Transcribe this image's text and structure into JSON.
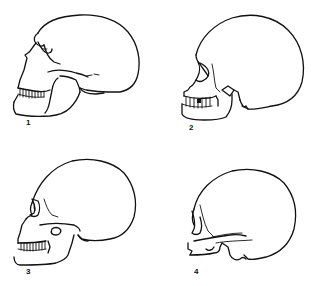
{
  "figure": {
    "panels": [
      {
        "id": 1,
        "label": "1",
        "subject": "skull-profile-left-view"
      },
      {
        "id": 2,
        "label": "2",
        "subject": "skull-profile-left-view"
      },
      {
        "id": 3,
        "label": "3",
        "subject": "skull-profile-left-view"
      },
      {
        "id": 4,
        "label": "4",
        "subject": "skull-profile-left-view-no-mandible"
      }
    ],
    "colors": {
      "line": "#111111",
      "background": "#ffffff"
    }
  }
}
